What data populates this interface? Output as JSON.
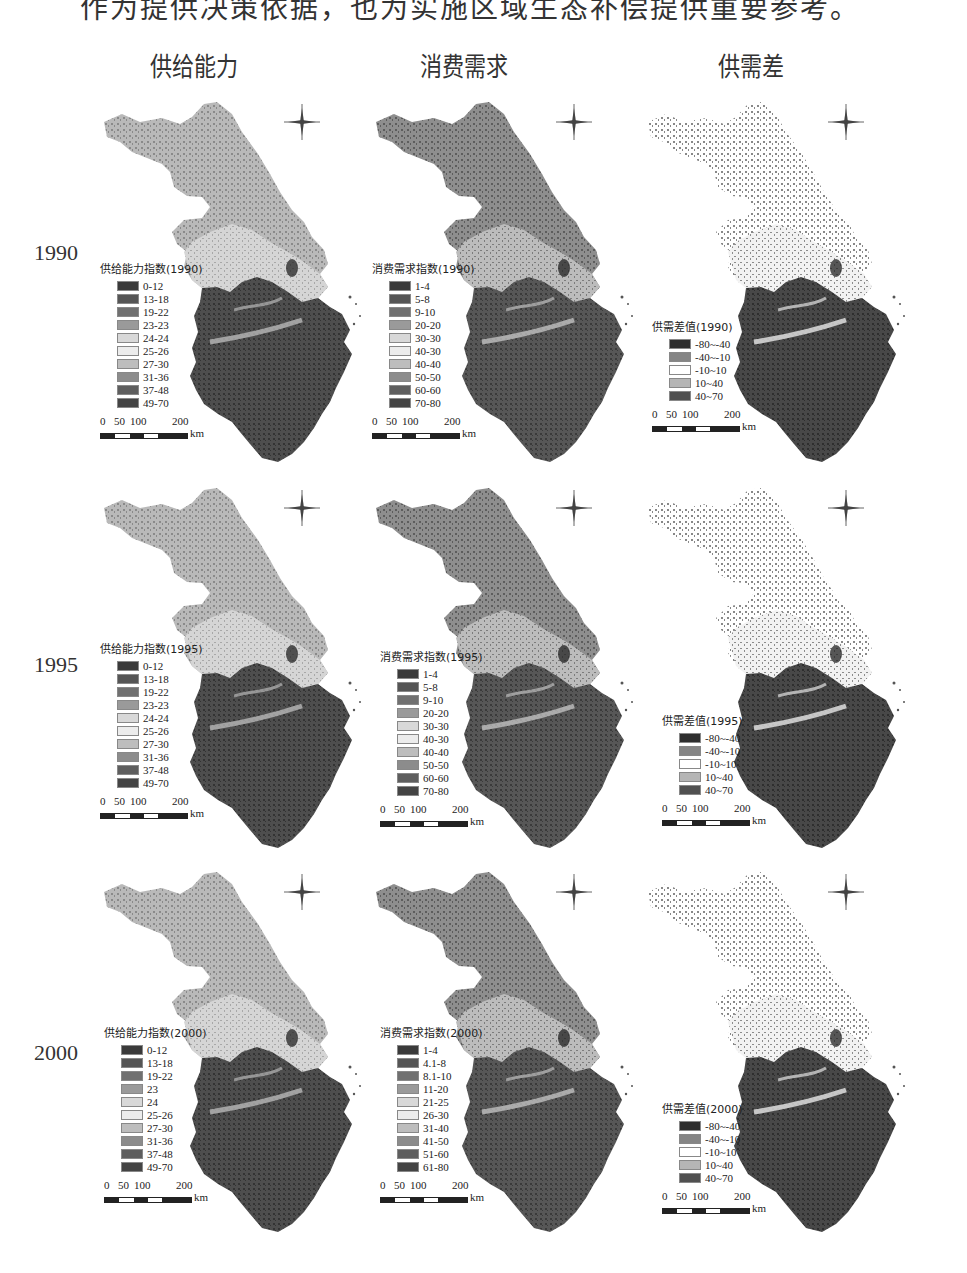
{
  "page": {
    "cut_text": "作为提供决策依据，也为实施区域生态补偿提供重要参考。"
  },
  "columns": [
    {
      "title": "供给能力",
      "key": "supply"
    },
    {
      "title": "消费需求",
      "key": "demand"
    },
    {
      "title": "供需差",
      "key": "diff"
    }
  ],
  "rows": [
    {
      "year": "1990",
      "panels": [
        {
          "legend_title": "供给能力指数(1990)",
          "classes": [
            "0-12",
            "13-18",
            "19-22",
            "23-23",
            "24-24",
            "25-26",
            "27-30",
            "31-36",
            "37-48",
            "49-70"
          ]
        },
        {
          "legend_title": "消费需求指数(1990)",
          "classes": [
            "1-4",
            "5-8",
            "9-10",
            "20-20",
            "30-30",
            "40-30",
            "40-40",
            "50-50",
            "60-60",
            "70-80"
          ]
        },
        {
          "legend_title": "供需差值(1990)",
          "classes": [
            "-80~-40",
            "-40~-10",
            "-10~10",
            "10~40",
            "40~70"
          ]
        }
      ]
    },
    {
      "year": "1995",
      "panels": [
        {
          "legend_title": "供给能力指数(1995)",
          "classes": [
            "0-12",
            "13-18",
            "19-22",
            "23-23",
            "24-24",
            "25-26",
            "27-30",
            "31-36",
            "37-48",
            "49-70"
          ]
        },
        {
          "legend_title": "消费需求指数(1995)",
          "classes": [
            "1-4",
            "5-8",
            "9-10",
            "20-20",
            "30-30",
            "40-30",
            "40-40",
            "50-50",
            "60-60",
            "70-80"
          ]
        },
        {
          "legend_title": "供需差值(1995)",
          "classes": [
            "-80~-40",
            "-40~-10",
            "-10~10",
            "10~40",
            "40~70"
          ]
        }
      ]
    },
    {
      "year": "2000",
      "panels": [
        {
          "legend_title": "供给能力指数(2000)",
          "classes": [
            "0-12",
            "13-18",
            "19-22",
            "23",
            "24",
            "25-26",
            "27-30",
            "31-36",
            "37-48",
            "49-70"
          ]
        },
        {
          "legend_title": "消费需求指数(2000)",
          "classes": [
            "1-4",
            "4.1-8",
            "8.1-10",
            "11-20",
            "21-25",
            "26-30",
            "31-40",
            "41-50",
            "51-60",
            "61-80"
          ]
        },
        {
          "legend_title": "供需差值(2000)",
          "classes": [
            "-80~-40",
            "-40~-10",
            "-10~10",
            "10~40",
            "40~70"
          ]
        }
      ]
    }
  ],
  "scale": {
    "ticks": [
      "0",
      "50",
      "100",
      "200"
    ],
    "unit": "km"
  },
  "colors": {
    "ten_class": [
      "#3a3a3a",
      "#555555",
      "#707070",
      "#9a9a9a",
      "#d8d8d8",
      "#ececec",
      "#bdbdbd",
      "#8c8c8c",
      "#5e5e5e",
      "#444444"
    ],
    "five_class": [
      "#2e2e2e",
      "#858585",
      "#ffffff",
      "#b5b5b5",
      "#505050"
    ]
  }
}
